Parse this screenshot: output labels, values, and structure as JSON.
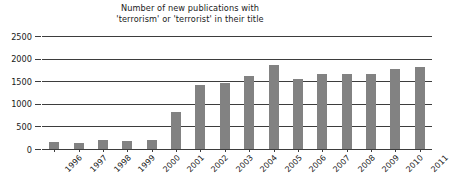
{
  "chart_data": {
    "type": "bar",
    "title": "Number of new publications with 'terrorism' or 'terrorist' in their title",
    "title_lines": [
      "Number of new publications with",
      "'terrorism' or 'terrorist' in their title"
    ],
    "xlabel": "",
    "ylabel": "",
    "ylim": [
      0,
      2500
    ],
    "ytick_labels": [
      "2500",
      "2000",
      "1500",
      "1000",
      "500",
      "0"
    ],
    "ytick_values": [
      2500,
      2000,
      1500,
      1000,
      500,
      0
    ],
    "grid": true,
    "legend": false,
    "bar_color": "#828282",
    "axis_color": "#3d3d3d",
    "background": "#ffffff",
    "categories": [
      "1996",
      "1997",
      "1998",
      "1999",
      "2000",
      "2001",
      "2002",
      "2003",
      "2004",
      "2005",
      "2006",
      "2007",
      "2008",
      "2009",
      "2010",
      "2011"
    ],
    "values": [
      150,
      140,
      210,
      175,
      205,
      810,
      1420,
      1450,
      1620,
      1850,
      1545,
      1665,
      1660,
      1665,
      1760,
      1810
    ],
    "series": [
      {
        "name": "New publications",
        "values": [
          150,
          140,
          210,
          175,
          205,
          810,
          1420,
          1450,
          1620,
          1850,
          1545,
          1665,
          1660,
          1665,
          1760,
          1810
        ]
      }
    ]
  }
}
